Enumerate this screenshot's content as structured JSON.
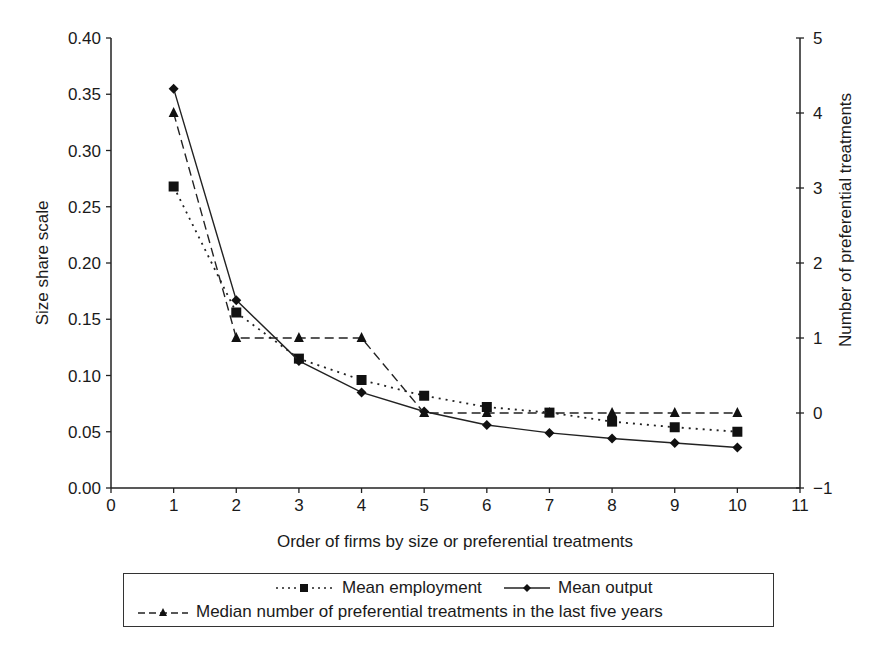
{
  "chart_data": {
    "type": "line",
    "title": "",
    "xlabel": "Order of firms by size or preferential treatments",
    "ylabel": "Size share scale",
    "y2label": "Number of preferential treatments",
    "xlim": [
      0,
      11
    ],
    "ylim": [
      0.0,
      0.4
    ],
    "y2lim": [
      -1,
      5
    ],
    "x_ticks": [
      "0",
      "1",
      "2",
      "3",
      "4",
      "5",
      "6",
      "7",
      "8",
      "9",
      "10",
      "11"
    ],
    "y_ticks": [
      "0.00",
      "0.05",
      "0.10",
      "0.15",
      "0.20",
      "0.25",
      "0.30",
      "0.35",
      "0.40"
    ],
    "y2_ticks": [
      "−1",
      "0",
      "1",
      "2",
      "3",
      "4",
      "5"
    ],
    "grid": false,
    "legend_position": "bottom",
    "x": [
      1,
      2,
      3,
      4,
      5,
      6,
      7,
      8,
      9,
      10
    ],
    "series": [
      {
        "name": "Mean employment",
        "axis": "left",
        "style": "dotted",
        "marker": "square",
        "values": [
          0.268,
          0.156,
          0.115,
          0.096,
          0.082,
          0.072,
          0.067,
          0.059,
          0.054,
          0.05
        ]
      },
      {
        "name": "Mean output",
        "axis": "left",
        "style": "solid",
        "marker": "diamond",
        "values": [
          0.355,
          0.167,
          0.113,
          0.085,
          0.068,
          0.056,
          0.049,
          0.044,
          0.04,
          0.036
        ]
      },
      {
        "name": "Median number of preferential treatments in the last five years",
        "axis": "right",
        "style": "dashed",
        "marker": "triangle",
        "values": [
          4,
          1,
          1,
          1,
          0,
          0,
          0,
          0,
          0,
          0
        ]
      }
    ]
  },
  "legend": {
    "item1": "Mean employment",
    "item2": "Mean output",
    "item3": "Median number of preferential treatments in the last five years"
  }
}
